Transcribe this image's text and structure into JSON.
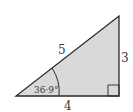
{
  "diagram": {
    "type": "right-triangle",
    "fill_color": "#d9d9d9",
    "stroke_color": "#2a2a2a",
    "sides": {
      "hypotenuse": "5",
      "opposite": "3",
      "adjacent": "4"
    },
    "angle_label": "36·9°",
    "right_angle_marker": true
  }
}
